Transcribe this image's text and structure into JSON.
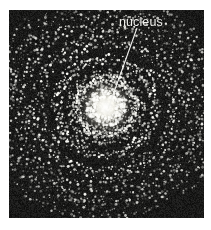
{
  "figure": {
    "kind": "astronomical-plate",
    "annotations": [
      {
        "id": "nucleus",
        "label": "nucleus",
        "leader_from": [
          128,
          18
        ],
        "leader_to": [
          99,
          99
        ]
      }
    ],
    "colors": {
      "page_background": "#ffffff",
      "plate_background": "#0d0d0c",
      "plate_noise_dark": "#141413",
      "star_bright": "#ffffff",
      "star_mid": "#cfcfc8",
      "star_dim": "#7b7b74",
      "nucleus_core": "#ffffff",
      "nucleus_glow": "#f5f3e8",
      "label_text": "#f2f2ef",
      "leader_line": "#f2f2ef"
    },
    "plate": {
      "left": 9,
      "top": 10,
      "width": 195,
      "height": 208
    },
    "nucleus_center": [
      97,
      97
    ],
    "nucleus_core_radius": 13,
    "nucleus_glow_radius": 30
  },
  "chart_data": {
    "type": "scatter",
    "title": "",
    "xlabel": "",
    "ylabel": "",
    "grid": false,
    "legend": null,
    "annotations": [
      {
        "text": "nucleus",
        "x": 128,
        "y": 18,
        "points_to_x": 99,
        "points_to_y": 99
      }
    ],
    "center": [
      97,
      97
    ],
    "arms": 4,
    "arm_pitch_deg": 16,
    "rings": [
      {
        "radius": 26,
        "points": 90,
        "brightness": 0.95,
        "spread": 5
      },
      {
        "radius": 44,
        "points": 120,
        "brightness": 0.85,
        "spread": 6
      },
      {
        "radius": 62,
        "points": 150,
        "brightness": 0.8,
        "spread": 7
      },
      {
        "radius": 80,
        "points": 170,
        "brightness": 0.72,
        "spread": 8
      },
      {
        "radius": 96,
        "points": 190,
        "brightness": 0.62,
        "spread": 9
      }
    ],
    "halo_points": 900,
    "halo_max_radius": 108
  }
}
